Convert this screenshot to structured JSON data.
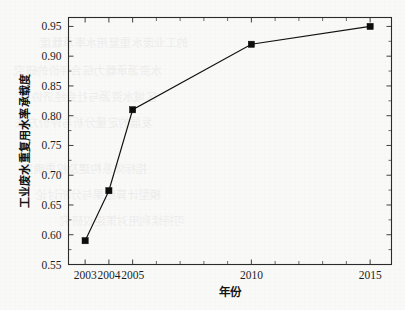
{
  "chart_data": {
    "type": "line",
    "title": "",
    "xlabel": "年份",
    "ylabel": "工业废水重复用水率承载度",
    "x": [
      2003,
      2004,
      2005,
      2010,
      2015
    ],
    "values": [
      0.59,
      0.674,
      0.81,
      0.92,
      0.95
    ],
    "series": [
      {
        "name": "工业废水重复用水率承载度",
        "values": [
          0.59,
          0.674,
          0.81,
          0.92,
          0.95
        ]
      }
    ],
    "xtick_labels": [
      "2003",
      "2004",
      "2005",
      "2010",
      "2015"
    ],
    "xtick_values": [
      2003,
      2004,
      2005,
      2010,
      2015
    ],
    "ytick_labels": [
      "0.55",
      "0.60",
      "0.65",
      "0.70",
      "0.75",
      "0.80",
      "0.85",
      "0.90",
      "0.95"
    ],
    "ytick_values": [
      0.55,
      0.6,
      0.65,
      0.7,
      0.75,
      0.8,
      0.85,
      0.9,
      0.95
    ],
    "xlim": [
      2002.3,
      2015.9
    ],
    "ylim": [
      0.55,
      0.965
    ],
    "grid": false,
    "legend": "none",
    "marker": "filled-square",
    "line_color": "#111111",
    "marker_color": "#0d0d0d",
    "minor_xticks": [
      2003,
      2004,
      2005,
      2006,
      2007,
      2008,
      2009,
      2010,
      2011,
      2012,
      2013,
      2014,
      2015
    ],
    "minor_yticks": [
      0.575,
      0.625,
      0.675,
      0.725,
      0.775,
      0.825,
      0.875,
      0.925
    ]
  },
  "figure": {
    "background_color": "#fbfbfa",
    "axis_color": "#2b2b2b"
  },
  "scan_artifacts": {
    "bleed_lines": [
      "的工业废水重复用水率承载度",
      "水资源承载力综合评价的研究",
      "区域水资源与社会经济协调",
      "发展的定量分析与评价方法",
      "指标体系构建及权重确定",
      "模型计算结果与分析讨论",
      "可持续利用对策建议研究"
    ]
  }
}
